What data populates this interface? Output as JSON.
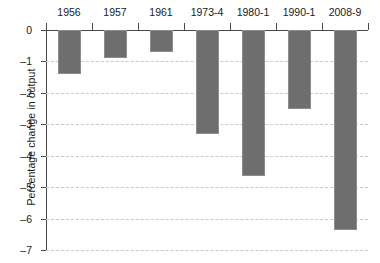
{
  "chart_data": {
    "type": "bar",
    "title": "",
    "xlabel": "",
    "ylabel": "Percentage change in output",
    "categories": [
      "1956",
      "1957",
      "1961",
      "1973-4",
      "1980-1",
      "1990-1",
      "2008-9"
    ],
    "values": [
      -1.4,
      -0.9,
      -0.7,
      -3.3,
      -4.65,
      -2.5,
      -6.35
    ],
    "ylim": [
      -7,
      0
    ],
    "y_ticks": [
      "0",
      "–1",
      "–2",
      "–3",
      "–4",
      "–5",
      "–6",
      "–7"
    ],
    "y_tick_values": [
      0,
      -1,
      -2,
      -3,
      -4,
      -5,
      -6,
      -7
    ],
    "grid": true,
    "legend": "none",
    "bar_color": "#6e6e6e",
    "gridline_color": "#c9c9c9",
    "axis_color": "#4a4a4a",
    "xaxis_position": "top"
  }
}
